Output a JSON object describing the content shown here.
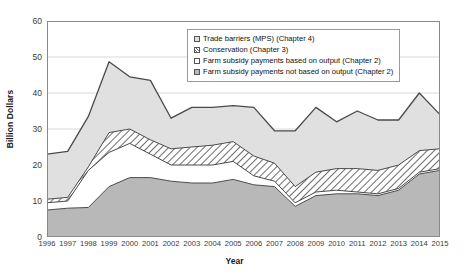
{
  "chart_data": {
    "type": "area",
    "title": "",
    "xlabel": "Year",
    "ylabel": "Billion Dollars",
    "ylim": [
      0,
      60
    ],
    "yticks": [
      0,
      10,
      20,
      30,
      40,
      50,
      60
    ],
    "grid": true,
    "legend_position": "top-center",
    "stacked": true,
    "categories": [
      1996,
      1997,
      1998,
      1999,
      2000,
      2001,
      2002,
      2003,
      2004,
      2005,
      2006,
      2007,
      2008,
      2009,
      2010,
      2011,
      2012,
      2013,
      2014,
      2015
    ],
    "series": [
      {
        "name": "Farm subsidy payments not based on output (Chapter 2)",
        "fill": "#b8b8b8",
        "pattern": "solid",
        "values": [
          7.5,
          8.0,
          8.2,
          14.0,
          16.5,
          16.5,
          15.5,
          15.0,
          15.0,
          16.0,
          14.5,
          14.0,
          8.5,
          11.5,
          12.0,
          12.0,
          11.5,
          13.0,
          17.5,
          18.5
        ]
      },
      {
        "name": "Farm subsidy payments based on output (Chapter 2)",
        "fill": "#ffffff",
        "pattern": "solid",
        "values": [
          2.0,
          2.0,
          10.3,
          9.5,
          9.5,
          6.5,
          4.5,
          5.0,
          5.0,
          5.0,
          2.5,
          1.5,
          1.0,
          1.0,
          1.0,
          0.5,
          0.5,
          0.5,
          0.5,
          0.5
        ]
      },
      {
        "name": "Conservation (Chapter 3)",
        "fill": "#ffffff",
        "pattern": "diagonal-hatch",
        "values": [
          1.0,
          1.0,
          1.0,
          5.5,
          4.0,
          4.0,
          4.5,
          5.0,
          5.5,
          5.5,
          5.5,
          5.0,
          4.5,
          5.5,
          6.0,
          6.5,
          6.5,
          6.5,
          6.0,
          5.5
        ]
      },
      {
        "name": "Trade barriers (MPS) (Chapter 4)",
        "fill": "#e0e0e0",
        "pattern": "solid",
        "values": [
          12.5,
          12.8,
          14.0,
          19.7,
          14.5,
          16.5,
          8.5,
          11.0,
          10.5,
          10.0,
          13.5,
          9.0,
          15.5,
          18.0,
          13.0,
          16.0,
          14.0,
          12.5,
          16.0,
          9.5
        ]
      }
    ],
    "totals": [
      23.0,
      23.8,
      33.5,
      48.7,
      44.5,
      43.5,
      33.0,
      36.0,
      36.0,
      36.5,
      36.0,
      29.5,
      29.5,
      36.0,
      32.0,
      35.0,
      32.5,
      32.5,
      40.0,
      34.0
    ]
  },
  "legend": {
    "items": [
      {
        "label": "Trade barriers (MPS) (Chapter 4)",
        "swatch": "light-gray"
      },
      {
        "label": "Conservation (Chapter 3)",
        "swatch": "hatched"
      },
      {
        "label": "Farm subsidy payments based on output (Chapter 2)",
        "swatch": "white"
      },
      {
        "label": "Farm subsidy payments not based on output (Chapter 2)",
        "swatch": "dark-gray"
      }
    ]
  },
  "axes": {
    "y_title": "Billion Dollars",
    "x_title": "Year",
    "y_tick_labels": [
      "0",
      "10",
      "20",
      "30",
      "40",
      "50",
      "60"
    ],
    "x_tick_labels": [
      "1996",
      "1997",
      "1998",
      "1999",
      "2000",
      "2001",
      "2002",
      "2003",
      "2004",
      "2005",
      "2006",
      "2007",
      "2008",
      "2009",
      "2010",
      "2011",
      "2012",
      "2013",
      "2014",
      "2015"
    ]
  },
  "colors": {
    "band_top": "#e0e0e0",
    "band_hatch_bg": "#ffffff",
    "band_hatch_line": "#777777",
    "band_white": "#ffffff",
    "band_bottom": "#b8b8b8",
    "outline": "#4a4a4a",
    "grid": "#d9d9d9",
    "axis": "#808080",
    "text": "#3a3a3a"
  }
}
